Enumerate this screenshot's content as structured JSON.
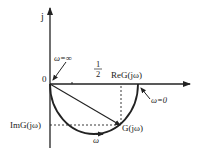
{
  "diagram": {
    "type": "nyquist-plot",
    "axes": {
      "imag_axis_label": "j",
      "origin_label": "0",
      "real_axis_label": "ReG(jω)",
      "imag_value_label": "ImG(jω)"
    },
    "annotations": {
      "omega_infinity": "ω=∞",
      "omega_zero": "ω=0",
      "half_numerator": "1",
      "half_denominator": "2",
      "point_label": "G(jω)",
      "direction_label": "ω"
    },
    "colors": {
      "stroke": "#222222",
      "background": "#ffffff"
    }
  }
}
